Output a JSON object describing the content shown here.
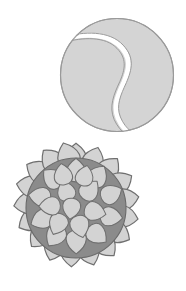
{
  "scene": {
    "title": "Two ball illustrations",
    "background_color": "#ffffff",
    "width": 186,
    "height": 291,
    "object_count": 2
  },
  "objects": [
    {
      "name": "tennis-ball",
      "label": "Tennis ball",
      "shape": "circle",
      "center": {
        "x": 117,
        "y": 75
      },
      "radius": 57,
      "fill_color": "#d4d4d4",
      "outline_color": "#9a9a9a",
      "outline_width": 1,
      "seam": {
        "name": "tennis-ball-seam",
        "label": "Seam curve",
        "style": "s-curve",
        "fill_color": "#ffffff",
        "outline_color": "#9a9a9a",
        "outline_width": 1,
        "stroke_width": 5
      }
    },
    {
      "name": "spiky-ball",
      "label": "Knobbed spiky ball",
      "shape": "circle-with-spikes",
      "center": {
        "x": 76,
        "y": 70
      },
      "radius": 50,
      "body_fill_color": "#8b8b8b",
      "body_outline_color": "#6a6a6a",
      "spike_fill_color": "#d3d3d3",
      "spike_outline_color": "#6f6f6f",
      "spike_outline_width": 1,
      "rim_spike_count": 18,
      "inner_spike_count": 19,
      "inner_spike_rings": [
        {
          "ring": "outer",
          "count": 11,
          "orbit_radius": 38,
          "size": 9
        },
        {
          "ring": "middle",
          "count": 6,
          "orbit_radius": 22,
          "size": 9
        },
        {
          "ring": "center",
          "count": 2,
          "orbit_radius": 7,
          "size": 8
        }
      ]
    }
  ],
  "colors": {
    "background": "#ffffff",
    "light_gray": "#d4d4d4",
    "mid_gray": "#8b8b8b",
    "dark_outline": "#6a6a6a",
    "soft_outline": "#9a9a9a",
    "white": "#ffffff"
  }
}
